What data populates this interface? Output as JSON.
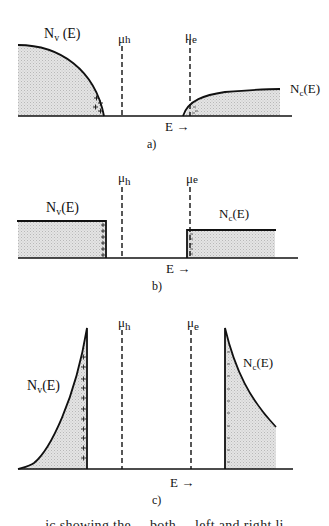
{
  "figure": {
    "panels": [
      {
        "id": "a",
        "label": "a)",
        "valence_label_main": "N",
        "valence_label_sub": "v",
        "valence_label_tail": " (E)",
        "conduction_label_main": "N",
        "conduction_label_sub": "c",
        "conduction_label_tail": "(E)",
        "mu_h_main": "μ",
        "mu_h_sub": "h",
        "mu_e_main": "μ",
        "mu_e_sub": "e",
        "axis_label": "E →",
        "valence_shape": "square-root decreasing to band edge",
        "conduction_shape": "square-root increasing from band edge",
        "holes_marker": "+",
        "electrons_marker": "-"
      },
      {
        "id": "b",
        "label": "b)",
        "valence_label_main": "N",
        "valence_label_sub": "v",
        "valence_label_tail": "(E)",
        "conduction_label_main": "N",
        "conduction_label_sub": "c",
        "conduction_label_tail": "(E)",
        "mu_h_main": "μ",
        "mu_h_sub": "h",
        "mu_e_main": "μ",
        "mu_e_sub": "e",
        "axis_label": "E →",
        "valence_shape": "step (constant)",
        "conduction_shape": "step (constant)",
        "holes_marker": "+",
        "electrons_marker": "-"
      },
      {
        "id": "c",
        "label": "c)",
        "valence_label_main": "N",
        "valence_label_sub": "v",
        "valence_label_tail": "(E)",
        "conduction_label_main": "N",
        "conduction_label_sub": "c",
        "conduction_label_tail": "(E)",
        "mu_h_main": "μ",
        "mu_h_sub": "h",
        "mu_e_main": "μ",
        "mu_e_sub": "e",
        "axis_label": "E →",
        "valence_shape": "rising to sharp peak at band edge",
        "conduction_shape": "sharp peak at band edge decaying",
        "holes_marker": "+",
        "electrons_marker": "-"
      }
    ],
    "caption_partial": "ic showing the ... both ... left and right li",
    "colors": {
      "line": "#111111",
      "fill": "#d6d6d6",
      "background": "#ffffff"
    }
  }
}
